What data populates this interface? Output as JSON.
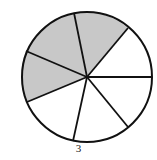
{
  "figure": {
    "label": "3",
    "total_sectors": 7,
    "shaded_sectors": 3,
    "shade_color": "#c8c8c8",
    "line_color": "#111111",
    "center": [
      87,
      77
    ],
    "radius": 65,
    "spokes": [
      [
        128,
        28
      ],
      [
        152,
        77
      ],
      [
        128,
        127
      ],
      [
        73,
        140
      ],
      [
        27,
        102
      ],
      [
        26,
        51
      ],
      [
        74,
        13
      ]
    ]
  }
}
